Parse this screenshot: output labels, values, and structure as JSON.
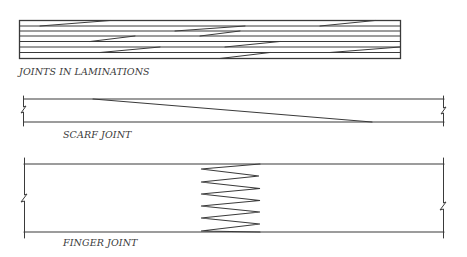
{
  "diagram": {
    "colors": {
      "line": "#3a3a3a",
      "background": "#ffffff",
      "text": "#3a3a3a"
    },
    "figures": [
      {
        "id": "laminations",
        "label": "JOINTS IN LAMINATIONS",
        "lamination_count": 7
      },
      {
        "id": "scarf",
        "label": "SCARF JOINT"
      },
      {
        "id": "finger",
        "label": "FINGER JOINT",
        "finger_count": 5
      }
    ]
  }
}
